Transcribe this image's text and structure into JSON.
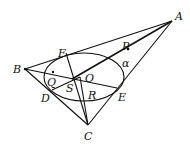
{
  "diagram": {
    "type": "geometry",
    "points": {
      "A": {
        "label": "A",
        "x": 172,
        "y": 21,
        "lx": 175,
        "ly": 20
      },
      "B": {
        "label": "B",
        "x": 25,
        "y": 69,
        "lx": 13,
        "ly": 73
      },
      "C": {
        "label": "C",
        "x": 88,
        "y": 125,
        "lx": 84,
        "ly": 140
      },
      "D": {
        "label": "D",
        "x": 52,
        "y": 90,
        "lx": 41,
        "ly": 102
      },
      "E": {
        "label": "E",
        "x": 117,
        "y": 88,
        "lx": 118,
        "ly": 101
      },
      "F": {
        "label": "F",
        "x": 66,
        "y": 53,
        "lx": 58,
        "ly": 57
      },
      "P": {
        "label": "P",
        "x": 128,
        "y": 49,
        "lx": 122,
        "ly": 50
      },
      "O": {
        "label": "O",
        "x": 80,
        "y": 77,
        "lx": 85,
        "ly": 82
      },
      "S": {
        "label": "S",
        "x": 72,
        "y": 79,
        "lx": 66,
        "ly": 92
      },
      "Q": {
        "label": "Q",
        "x": 53,
        "y": 72,
        "lx": 47,
        "ly": 86
      },
      "R": {
        "label": "R",
        "x": 86,
        "y": 88,
        "lx": 88,
        "ly": 99
      }
    },
    "angle_label": {
      "label": "α",
      "lx": 122,
      "ly": 67
    },
    "ellipse": {
      "cx": 84,
      "cy": 77,
      "rx": 40,
      "ry": 24,
      "rotate": 0
    }
  }
}
